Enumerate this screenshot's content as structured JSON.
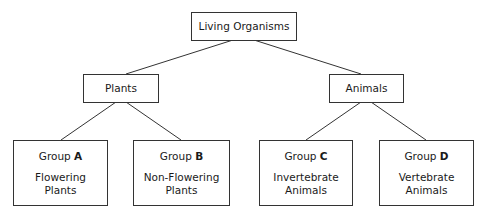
{
  "root": {
    "label": "Living Organisms"
  },
  "level1": [
    {
      "label": "Plants"
    },
    {
      "label": "Animals"
    }
  ],
  "groups": [
    {
      "prefix": "Group ",
      "letter": "A",
      "line1": "Flowering",
      "line2": "Plants"
    },
    {
      "prefix": "Group ",
      "letter": "B",
      "line1": "Non-Flowering",
      "line2": "Plants"
    },
    {
      "prefix": "Group ",
      "letter": "C",
      "line1": "Invertebrate",
      "line2": "Animals"
    },
    {
      "prefix": "Group ",
      "letter": "D",
      "line1": "Vertebrate",
      "line2": "Animals"
    }
  ]
}
